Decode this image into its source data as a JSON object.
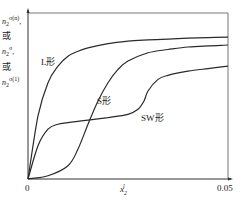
{
  "chart_data": {
    "type": "line",
    "title": "",
    "xlabel": "x₂^l",
    "ylabel": "n₂^{σ(n)} 或 n₂^{σ} 或 n₂^{σ(1)}",
    "ylabel_parts": {
      "var": "n",
      "sub": "2",
      "sup_1": "σ(n)",
      "or_1": "或",
      "sup_2": "σ",
      "or_2": "或",
      "sup_3": "σ(1)"
    },
    "xlim": [
      0,
      0.05
    ],
    "ylim": [
      0,
      1
    ],
    "x_ticks": [
      "0",
      "0.05"
    ],
    "y_ticks": [],
    "grid": false,
    "legend": "inline curve labels",
    "series": [
      {
        "name": "L形",
        "label": "L形",
        "x": [
          0,
          0.0025,
          0.005,
          0.0075,
          0.01,
          0.0125,
          0.015,
          0.02,
          0.025,
          0.03,
          0.035,
          0.04,
          0.045,
          0.05
        ],
        "y": [
          0,
          0.38,
          0.58,
          0.68,
          0.74,
          0.77,
          0.79,
          0.815,
          0.83,
          0.838,
          0.843,
          0.848,
          0.852,
          0.855
        ]
      },
      {
        "name": "S形",
        "label": "S形",
        "x": [
          0,
          0.005,
          0.01,
          0.0125,
          0.015,
          0.0175,
          0.02,
          0.0225,
          0.025,
          0.03,
          0.035,
          0.04,
          0.045,
          0.05
        ],
        "y": [
          0,
          0.02,
          0.08,
          0.18,
          0.33,
          0.47,
          0.58,
          0.66,
          0.71,
          0.76,
          0.78,
          0.795,
          0.802,
          0.807
        ]
      },
      {
        "name": "SW形",
        "label": "SW形",
        "x": [
          0,
          0.0025,
          0.005,
          0.0075,
          0.01,
          0.015,
          0.02,
          0.025,
          0.0275,
          0.029,
          0.03,
          0.0325,
          0.035,
          0.04,
          0.045,
          0.05
        ],
        "y": [
          0,
          0.2,
          0.3,
          0.33,
          0.34,
          0.355,
          0.37,
          0.39,
          0.42,
          0.47,
          0.53,
          0.6,
          0.625,
          0.65,
          0.665,
          0.68
        ]
      }
    ]
  },
  "labels": {
    "curve_L": "L形",
    "curve_S": "S形",
    "curve_SW": "SW形",
    "x_tick_0": "0",
    "x_tick_end": "0.05",
    "x_axis_var": "x",
    "x_axis_sub": "2",
    "x_axis_sup": "l",
    "y_var": "n",
    "y_sub": "2",
    "y_sup_1": "σ(n)",
    "y_or_1": "或",
    "y_sup_2": "σ",
    "y_or_2": "或",
    "y_sup_3": "σ(1)"
  },
  "colors": {
    "line": "#2a2a2a",
    "axis": "#333333",
    "frame": "#888888"
  }
}
